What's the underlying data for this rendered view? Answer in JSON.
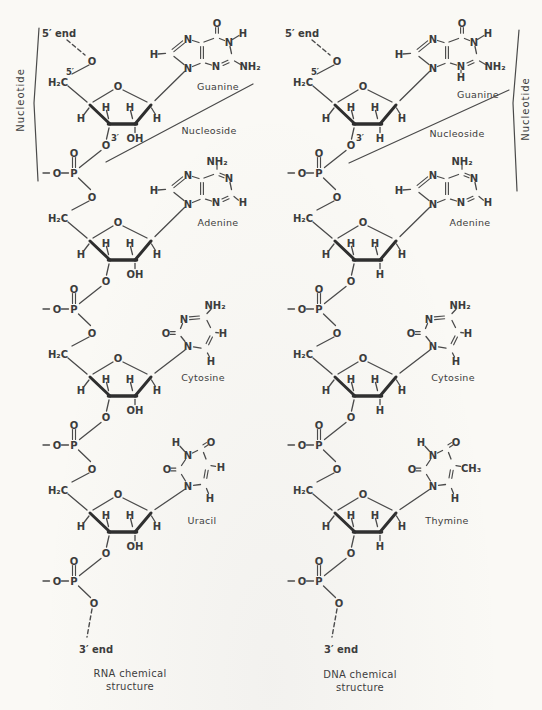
{
  "figure": {
    "background_color": "#faf9f5",
    "ink_color": "#3c3c3c",
    "kind": "nucleic-acid chemical structure comparison"
  },
  "atoms": {
    "O": "O",
    "P": "P",
    "N": "N",
    "H": "H",
    "OH": "OH",
    "NH2": "NH₂",
    "H2C": "H₂C",
    "CH3": "CH₃"
  },
  "labels": {
    "five_prime": "5′",
    "three_prime": "3′"
  },
  "columns": [
    {
      "id": "rna",
      "five_end": "5′ end",
      "three_end": "3′ end",
      "bracket_label": "Nucleotide",
      "nucleoside_label": "Nucleoside",
      "sugar_c2_group": "OH",
      "caption": [
        "RNA chemical",
        "structure"
      ],
      "units": [
        {
          "base": "guanine",
          "label": "Guanine",
          "n3_h": false
        },
        {
          "base": "adenine",
          "label": "Adenine"
        },
        {
          "base": "cytosine",
          "label": "Cytosine"
        },
        {
          "base": "uracil",
          "label": "Uracil"
        }
      ]
    },
    {
      "id": "dna",
      "five_end": "5′ end",
      "three_end": "3′ end",
      "bracket_label": "Nucleotide",
      "nucleoside_label": "Nucleoside",
      "sugar_c2_group": "H",
      "caption": [
        "DNA chemical",
        "structure"
      ],
      "units": [
        {
          "base": "guanine",
          "label": "Guanine",
          "n3_h": true
        },
        {
          "base": "adenine",
          "label": "Adenine"
        },
        {
          "base": "cytosine",
          "label": "Cytosine"
        },
        {
          "base": "thymine",
          "label": "Thymine"
        }
      ]
    }
  ]
}
